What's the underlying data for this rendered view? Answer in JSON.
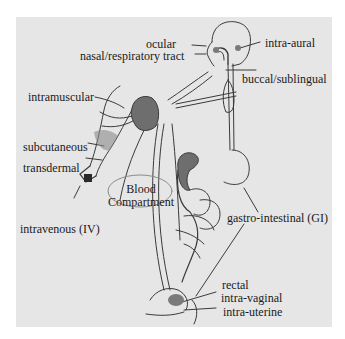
{
  "diagram": {
    "blood_compartment": {
      "line1": "Blood",
      "line2": "Compartment"
    },
    "routes": [
      {
        "id": "ocular",
        "label": "ocular"
      },
      {
        "id": "nasal",
        "label": "nasal/respiratory tract"
      },
      {
        "id": "intra-aural",
        "label": "intra-aural"
      },
      {
        "id": "buccal",
        "label": "buccal/sublingual"
      },
      {
        "id": "intramuscular",
        "label": "intramuscular"
      },
      {
        "id": "subcutaneous",
        "label": "subcutaneous"
      },
      {
        "id": "transdermal",
        "label": "transdermal"
      },
      {
        "id": "intravenous",
        "label": "intravenous (IV)"
      },
      {
        "id": "gi",
        "label": "gastro-intestinal (GI)"
      },
      {
        "id": "rectal",
        "label": "rectal"
      },
      {
        "id": "intra-vaginal",
        "label": "intra-vaginal"
      },
      {
        "id": "intra-uterine",
        "label": "intra-uterine"
      }
    ],
    "colors": {
      "panel": "#e6e6e6",
      "organ": "#6e6e6e",
      "line": "#3a3a3a",
      "text": "#1a1a1a"
    }
  }
}
